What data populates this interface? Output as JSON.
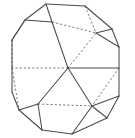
{
  "figure": {
    "background_color": "#ffffff",
    "visible_edge_color": "#4a4a52",
    "hidden_edge_color": "#6f6f78",
    "canvas": {
      "width": 135,
      "height": 138
    },
    "vertices": {
      "center": [
        68,
        68
      ],
      "outline": [
        [
          46,
          4
        ],
        [
          85,
          6
        ],
        [
          112,
          29
        ],
        [
          119,
          47
        ],
        [
          119,
          96
        ],
        [
          107,
          118
        ],
        [
          72,
          134
        ],
        [
          42,
          130
        ],
        [
          19,
          110
        ],
        [
          12,
          92
        ],
        [
          12,
          40
        ],
        [
          25,
          20
        ]
      ],
      "inner_upper": [
        52,
        22
      ],
      "inner_upper_right": [
        96,
        33
      ],
      "inner_left": [
        12,
        68
      ],
      "inner_right": [
        119,
        68
      ],
      "inner_lower_left": [
        38,
        104
      ],
      "inner_lower_right": [
        92,
        106
      ]
    },
    "visible_edges": [
      {
        "name": "outline-top",
        "from": [
          46,
          4
        ],
        "to": [
          85,
          6
        ]
      },
      {
        "name": "outline-top-right",
        "from": [
          85,
          6
        ],
        "to": [
          112,
          29
        ]
      },
      {
        "name": "outline-right-upper",
        "from": [
          112,
          29
        ],
        "to": [
          119,
          47
        ]
      },
      {
        "name": "outline-right",
        "from": [
          119,
          47
        ],
        "to": [
          119,
          96
        ]
      },
      {
        "name": "outline-right-lower",
        "from": [
          119,
          96
        ],
        "to": [
          107,
          118
        ]
      },
      {
        "name": "outline-bottom-right",
        "from": [
          107,
          118
        ],
        "to": [
          72,
          134
        ]
      },
      {
        "name": "outline-bottom",
        "from": [
          72,
          134
        ],
        "to": [
          42,
          130
        ]
      },
      {
        "name": "outline-bottom-left",
        "from": [
          42,
          130
        ],
        "to": [
          19,
          110
        ]
      },
      {
        "name": "outline-left-lower",
        "from": [
          19,
          110
        ],
        "to": [
          12,
          92
        ]
      },
      {
        "name": "outline-left",
        "from": [
          12,
          92
        ],
        "to": [
          12,
          40
        ]
      },
      {
        "name": "outline-left-upper",
        "from": [
          12,
          40
        ],
        "to": [
          25,
          20
        ]
      },
      {
        "name": "outline-top-left",
        "from": [
          25,
          20
        ],
        "to": [
          46,
          4
        ]
      },
      {
        "name": "spoke-upper-left",
        "from": [
          68,
          68
        ],
        "to": [
          52,
          22
        ]
      },
      {
        "name": "spoke-right",
        "from": [
          68,
          68
        ],
        "to": [
          119,
          68
        ]
      },
      {
        "name": "spoke-lower-left",
        "from": [
          68,
          68
        ],
        "to": [
          38,
          104
        ]
      },
      {
        "name": "spoke-lower-right",
        "from": [
          68,
          68
        ],
        "to": [
          92,
          106
        ]
      },
      {
        "name": "ridge-upper-left",
        "from": [
          52,
          22
        ],
        "to": [
          25,
          20
        ]
      },
      {
        "name": "ridge-upper-top",
        "from": [
          52,
          22
        ],
        "to": [
          46,
          4
        ]
      },
      {
        "name": "ridge-left-upper",
        "from": [
          25,
          20
        ],
        "to": [
          12,
          40
        ]
      },
      {
        "name": "ridge-lower-left-vert",
        "from": [
          38,
          104
        ],
        "to": [
          19,
          110
        ]
      },
      {
        "name": "ridge-lower-left-bottom",
        "from": [
          38,
          104
        ],
        "to": [
          42,
          130
        ]
      },
      {
        "name": "ridge-lower-right-bottom",
        "from": [
          92,
          106
        ],
        "to": [
          72,
          134
        ]
      },
      {
        "name": "ridge-lower-right-side",
        "from": [
          92,
          106
        ],
        "to": [
          107,
          118
        ]
      },
      {
        "name": "ridge-right-side",
        "from": [
          92,
          106
        ],
        "to": [
          119,
          96
        ]
      },
      {
        "name": "ridge-right-upper-vert",
        "from": [
          96,
          33
        ],
        "to": [
          112,
          29
        ]
      },
      {
        "name": "ridge-right-upper-down",
        "from": [
          96,
          33
        ],
        "to": [
          119,
          47
        ]
      }
    ],
    "hidden_edges": [
      {
        "name": "spoke-left-hidden",
        "from": [
          68,
          68
        ],
        "to": [
          12,
          68
        ]
      },
      {
        "name": "spoke-upper-right-hidden",
        "from": [
          68,
          68
        ],
        "to": [
          96,
          33
        ]
      },
      {
        "name": "hidden-top-right-arc",
        "from": [
          85,
          6
        ],
        "to": [
          96,
          33
        ]
      },
      {
        "name": "hidden-upper-chord",
        "from": [
          52,
          22
        ],
        "to": [
          96,
          33
        ]
      },
      {
        "name": "hidden-right-lower",
        "from": [
          119,
          68
        ],
        "to": [
          92,
          106
        ]
      },
      {
        "name": "hidden-left-vert",
        "from": [
          12,
          40
        ],
        "to": [
          12,
          68
        ]
      },
      {
        "name": "hidden-left-lower-vert",
        "from": [
          12,
          68
        ],
        "to": [
          19,
          110
        ]
      },
      {
        "name": "hidden-lower-chord",
        "from": [
          38,
          104
        ],
        "to": [
          92,
          106
        ]
      }
    ],
    "counts": {
      "outline_sides": 12,
      "center_spokes": 6,
      "visible_edge_count": 26,
      "hidden_edge_count": 8
    }
  }
}
